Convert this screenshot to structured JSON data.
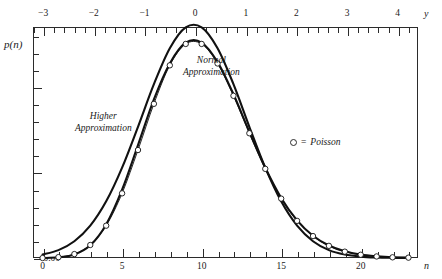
{
  "axes": {
    "y_axis_name": "p(n)",
    "top_axis_name": "y",
    "bottom_axis_name": "n",
    "top_tick_labels": [
      "-3",
      "-2",
      "-1",
      "0",
      "1",
      "2",
      "3",
      "4"
    ],
    "bottom_tick_labels": [
      "0",
      "5",
      "10",
      "15",
      "20"
    ],
    "left_tick_labels": [
      "0.00",
      "0.05",
      "0.10"
    ]
  },
  "annotations": {
    "normal_line1": "Normal",
    "normal_line2": "Approximation",
    "higher_line1": "Higher",
    "higher_line2": "Approximation"
  },
  "legend": {
    "marker": "circle",
    "equals": "=",
    "label": "Poisson"
  },
  "colors": {
    "axis": "#2b2b2b",
    "curve": "#111111",
    "marker_fill": "#ffffff",
    "background": "#ffffff"
  },
  "chart_data": {
    "type": "line",
    "title": "",
    "xlabel": "n",
    "ylabel": "p(n)",
    "xlim": [
      -0.6,
      23.6
    ],
    "ylim": [
      0.0,
      0.135
    ],
    "grid": false,
    "legend_position": "inside-right",
    "top_axis": {
      "label": "y",
      "ticks": [
        -3,
        -2,
        -1,
        0,
        1,
        2,
        3,
        4
      ],
      "minor_tick_step": 0.2,
      "range": [
        -3.2,
        4.4
      ]
    },
    "bottom_axis": {
      "label": "n",
      "ticks": [
        0,
        5,
        10,
        15,
        20
      ],
      "minor_tick_step": 1,
      "range": [
        -0.6,
        23.6
      ]
    },
    "left_axis": {
      "label": "p(n)",
      "ticks": [
        0.0,
        0.05,
        0.1
      ],
      "minor_tick_step": 0.01,
      "range": [
        0.0,
        0.135
      ]
    },
    "x": [
      0,
      1,
      2,
      3,
      4,
      5,
      6,
      7,
      8,
      9,
      10,
      11,
      12,
      13,
      14,
      15,
      16,
      17,
      18,
      19,
      20,
      21,
      22,
      23
    ],
    "series": [
      {
        "name": "Poisson",
        "style": "markers-with-line",
        "marker": "open-circle",
        "values": [
          0.0,
          0.0005,
          0.0023,
          0.0076,
          0.0189,
          0.0378,
          0.0631,
          0.0901,
          0.1126,
          0.1251,
          0.1251,
          0.1137,
          0.0948,
          0.0729,
          0.0521,
          0.0347,
          0.0217,
          0.0128,
          0.0071,
          0.0037,
          0.0019,
          0.0009,
          0.0004,
          0.0002
        ]
      },
      {
        "name": "Normal Approximation",
        "style": "line",
        "values": [
          0.002,
          0.0046,
          0.0098,
          0.0189,
          0.0331,
          0.0528,
          0.0767,
          0.1016,
          0.1226,
          0.1348,
          0.1348,
          0.1226,
          0.1016,
          0.0767,
          0.0528,
          0.0331,
          0.0189,
          0.0098,
          0.0046,
          0.002,
          0.0008,
          0.0003,
          0.0001,
          0.0
        ]
      },
      {
        "name": "Higher Approximation",
        "style": "line",
        "values": [
          0.0,
          0.0004,
          0.002,
          0.0074,
          0.0196,
          0.0399,
          0.066,
          0.0927,
          0.1137,
          0.1258,
          0.1259,
          0.1145,
          0.0957,
          0.0737,
          0.0527,
          0.0351,
          0.022,
          0.013,
          0.0073,
          0.0039,
          0.002,
          0.001,
          0.0004,
          0.0002
        ]
      }
    ]
  }
}
